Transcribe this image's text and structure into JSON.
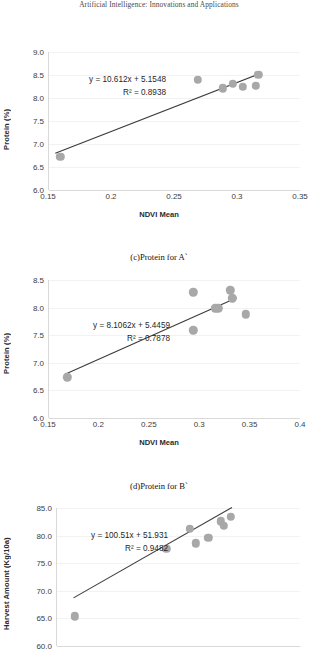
{
  "page": {
    "running_head": "Artificial Intelligence: Innovations and Applications"
  },
  "captions": {
    "chart_c": "(c)Protein for A`",
    "chart_d": "(d)Protein for B`"
  },
  "colors": {
    "marker": "#a8a8a8",
    "trendline": "#3b3b3b",
    "gridline": "#f2f2f2",
    "axis": "#d9d9d9",
    "tick_text": "#3d3d3d"
  },
  "chart_data": [
    {
      "id": "chart-c",
      "type": "scatter",
      "title": "",
      "xlabel": "NDVI Mean",
      "ylabel": "Protein (%)",
      "xlim": [
        0.15,
        0.35
      ],
      "ylim": [
        6.0,
        9.0
      ],
      "xticks": [
        "0.15",
        "0.2",
        "0.25",
        "0.3",
        "0.35"
      ],
      "xtick_values": [
        0.15,
        0.2,
        0.25,
        0.3,
        0.35
      ],
      "yticks": [
        "6.0",
        "6.5",
        "7.0",
        "7.5",
        "8.0",
        "8.5",
        "9.0"
      ],
      "ytick_values": [
        6.0,
        6.5,
        7.0,
        7.5,
        8.0,
        8.5,
        9.0
      ],
      "grid": true,
      "legend": "none",
      "equation": "y = 10.612x + 5.1548",
      "r2": "R² = 0.8938",
      "slope": 10.612,
      "intercept": 5.1548,
      "r2_value": 0.8938,
      "points": [
        {
          "x": 0.159,
          "y": 6.72
        },
        {
          "x": 0.268,
          "y": 8.4
        },
        {
          "x": 0.288,
          "y": 8.21
        },
        {
          "x": 0.296,
          "y": 8.31
        },
        {
          "x": 0.304,
          "y": 8.24
        },
        {
          "x": 0.314,
          "y": 8.26
        },
        {
          "x": 0.316,
          "y": 8.5
        }
      ],
      "trend_x": [
        0.155,
        0.317
      ]
    },
    {
      "id": "chart-d",
      "type": "scatter",
      "title": "",
      "xlabel": "NDVI Mean",
      "ylabel": "Protein (%)",
      "xlim": [
        0.15,
        0.4
      ],
      "ylim": [
        6.0,
        8.5
      ],
      "xticks": [
        "0.15",
        "0.2",
        "0.25",
        "0.3",
        "0.35",
        "0.4"
      ],
      "xtick_values": [
        0.15,
        0.2,
        0.25,
        0.3,
        0.35,
        0.4
      ],
      "yticks": [
        "6.0",
        "6.5",
        "7.0",
        "7.5",
        "8.0",
        "8.5"
      ],
      "ytick_values": [
        6.0,
        6.5,
        7.0,
        7.5,
        8.0,
        8.5
      ],
      "grid": true,
      "legend": "none",
      "equation": "y = 8.1062x + 5.4459",
      "r2": "R² = 0.7878",
      "slope": 8.1062,
      "intercept": 5.4459,
      "r2_value": 0.7878,
      "points": [
        {
          "x": 0.168,
          "y": 6.74
        },
        {
          "x": 0.293,
          "y": 8.28
        },
        {
          "x": 0.293,
          "y": 7.59
        },
        {
          "x": 0.315,
          "y": 7.99
        },
        {
          "x": 0.318,
          "y": 7.99
        },
        {
          "x": 0.33,
          "y": 8.31
        },
        {
          "x": 0.332,
          "y": 8.17
        },
        {
          "x": 0.345,
          "y": 7.88
        }
      ],
      "trend_x": [
        0.166,
        0.337
      ]
    },
    {
      "id": "chart-e",
      "type": "scatter",
      "title": "",
      "xlabel": "",
      "ylabel": "Harvest Amount (Kg/10a)",
      "xlim": [
        0.15,
        0.4
      ],
      "ylim": [
        60.0,
        85.0
      ],
      "xticks": [],
      "xtick_values": [],
      "yticks": [
        "60.0",
        "65.0",
        "70.0",
        "75.0",
        "80.0",
        "85.0"
      ],
      "ytick_values": [
        60.0,
        65.0,
        70.0,
        75.0,
        80.0,
        85.0
      ],
      "grid": true,
      "legend": "none",
      "equation": "y = 100.51x + 51.931",
      "r2": "R² = 0.9482",
      "slope": 100.51,
      "intercept": 51.931,
      "r2_value": 0.9482,
      "points": [
        {
          "x": 0.168,
          "y": 65.4
        },
        {
          "x": 0.262,
          "y": 77.6
        },
        {
          "x": 0.286,
          "y": 81.2
        },
        {
          "x": 0.292,
          "y": 78.6
        },
        {
          "x": 0.305,
          "y": 79.6
        },
        {
          "x": 0.318,
          "y": 82.6
        },
        {
          "x": 0.321,
          "y": 81.8
        },
        {
          "x": 0.328,
          "y": 83.4
        }
      ],
      "trend_x": [
        0.167,
        0.33
      ]
    }
  ]
}
